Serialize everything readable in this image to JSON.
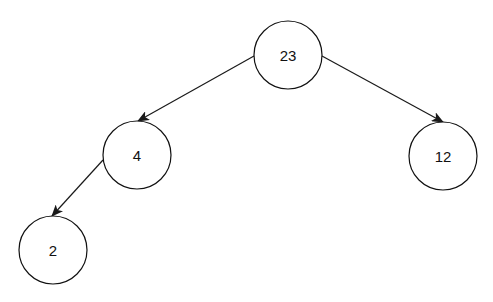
{
  "diagram": {
    "type": "binary-tree",
    "nodes": [
      {
        "id": "n23",
        "label": "23",
        "cx": 288,
        "cy": 55,
        "r": 34
      },
      {
        "id": "n4",
        "label": "4",
        "cx": 137,
        "cy": 155,
        "r": 34
      },
      {
        "id": "n12",
        "label": "12",
        "cx": 443,
        "cy": 156,
        "r": 34
      },
      {
        "id": "n2",
        "label": "2",
        "cx": 53,
        "cy": 250,
        "r": 34
      }
    ],
    "edges": [
      {
        "from": "23",
        "to": "4",
        "x1": 254,
        "y1": 56,
        "x2": 138,
        "y2": 121
      },
      {
        "from": "23",
        "to": "12",
        "x1": 322,
        "y1": 56,
        "x2": 443,
        "y2": 122
      },
      {
        "from": "4",
        "to": "2",
        "x1": 103,
        "y1": 160,
        "x2": 52,
        "y2": 216
      }
    ],
    "colors": {
      "stroke": "#111111",
      "fill": "#ffffff",
      "background": "#ffffff"
    }
  }
}
